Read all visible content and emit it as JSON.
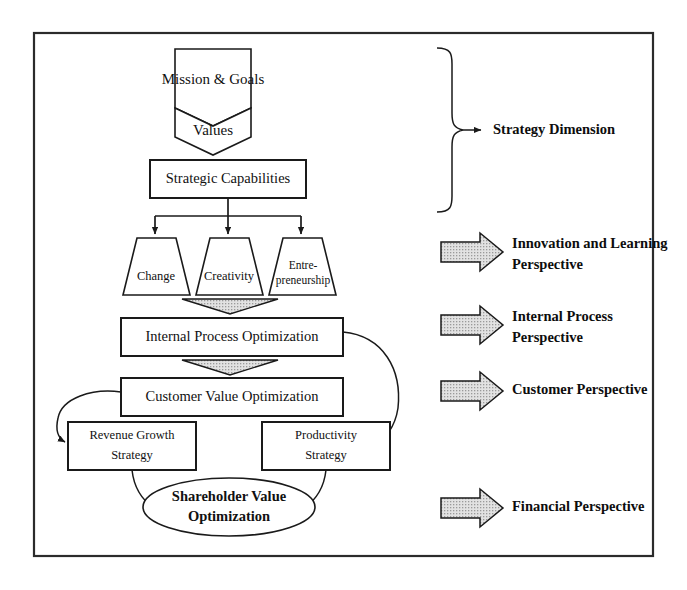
{
  "diagram": {
    "frame": {
      "x": 34,
      "y": 33,
      "width": 619,
      "height": 523
    },
    "colors": {
      "line": "#1a1a1a",
      "frame": "#2b2b2b",
      "shape_fill": "#ffffff",
      "arrow_fill": "#d4d4d4",
      "text": "#111111"
    },
    "nodes": {
      "mission_goals": "Mission & Goals",
      "values": "Values",
      "strategic_capabilities": "Strategic Capabilities",
      "change": "Change",
      "creativity": "Creativity",
      "entrepreneurship_line1": "Entre-",
      "entrepreneurship_line2": "preneurship",
      "internal_process_optimization": "Internal Process Optimization",
      "customer_value_optimization": "Customer Value Optimization",
      "revenue_growth_line1": "Revenue Growth",
      "revenue_growth_line2": "Strategy",
      "productivity_line1": "Productivity",
      "productivity_line2": "Strategy",
      "shareholder_value_line1": "Shareholder Value",
      "shareholder_value_line2": "Optimization"
    },
    "side_labels": {
      "strategy_dimension": "Strategy Dimension",
      "innovation_learning_line1": "Innovation and Learning",
      "innovation_learning_line2": "Perspective",
      "internal_process_line1": "Internal Process",
      "internal_process_line2": "Perspective",
      "customer_perspective": "Customer Perspective",
      "financial_perspective": "Financial Perspective"
    }
  }
}
